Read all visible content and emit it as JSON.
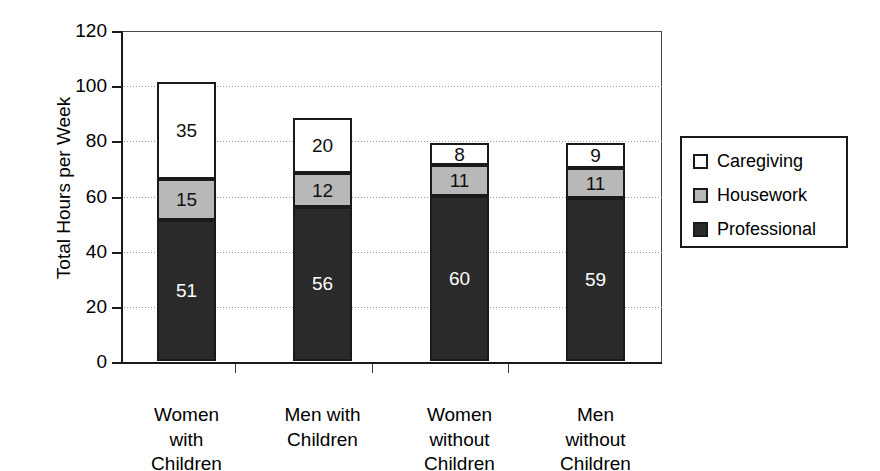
{
  "chart_data": {
    "type": "bar",
    "subtype": "stacked-bar",
    "title": "",
    "xlabel": "",
    "ylabel": "Total Hours per Week",
    "ylim": [
      0,
      120
    ],
    "ytick_values": [
      0,
      20,
      40,
      60,
      80,
      100,
      120
    ],
    "ytick_labels": [
      "0",
      "20",
      "40",
      "60",
      "80",
      "100",
      "120"
    ],
    "grid": true,
    "grid_axis": "y",
    "legend_position": "right",
    "categories": [
      "Women with Children",
      "Men with Children",
      "Women without Children",
      "Men without Children"
    ],
    "category_label_lines": [
      [
        "Women",
        "with",
        "Children"
      ],
      [
        "Men with",
        "Children"
      ],
      [
        "Women",
        "without",
        "Children"
      ],
      [
        "Men",
        "without",
        "Children"
      ]
    ],
    "series": [
      {
        "name": "Professional",
        "color": "#2b2b2b",
        "values": [
          51,
          56,
          60,
          59
        ],
        "labels": [
          "51",
          "56",
          "60",
          "59"
        ]
      },
      {
        "name": "Housework",
        "color": "#b8b8b8",
        "values": [
          15,
          12,
          11,
          11
        ],
        "labels": [
          "15",
          "12",
          "11",
          "11"
        ]
      },
      {
        "name": "Caregiving",
        "color": "#ffffff",
        "values": [
          35,
          20,
          8,
          9
        ],
        "labels": [
          "35",
          "20",
          "8",
          "9"
        ]
      }
    ],
    "totals": [
      101,
      88,
      79,
      79
    ],
    "stack_order_bottom_to_top": [
      "Professional",
      "Housework",
      "Caregiving"
    ]
  },
  "legend": {
    "items": [
      {
        "label": "Caregiving",
        "color": "#ffffff"
      },
      {
        "label": "Housework",
        "color": "#b8b8b8"
      },
      {
        "label": "Professional",
        "color": "#2b2b2b"
      }
    ]
  },
  "axis": {
    "y_title": "Total Hours per Week"
  }
}
